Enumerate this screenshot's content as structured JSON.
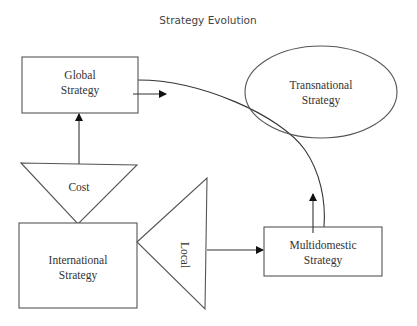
{
  "title": "Strategy Evolution",
  "colors": {
    "stroke": "#555555",
    "text": "#333333",
    "title": "#444444",
    "background": "#ffffff"
  },
  "nodes": {
    "global": {
      "shape": "rectangle",
      "line1": "Global",
      "line2": "Strategy"
    },
    "transnational": {
      "shape": "ellipse",
      "line1": "Transnational",
      "line2": "Strategy"
    },
    "international": {
      "shape": "rectangle",
      "line1": "International",
      "line2": "Strategy"
    },
    "multidomestic": {
      "shape": "rectangle",
      "line1": "Multidomestic",
      "line2": "Strategy"
    },
    "cost": {
      "shape": "triangle-down",
      "label": "Cost"
    },
    "local": {
      "shape": "triangle-left",
      "label": "Local"
    }
  },
  "edges": [
    {
      "from": "cost",
      "to": "global",
      "type": "arrow"
    },
    {
      "from": "local",
      "to": "multidomestic",
      "type": "arrow"
    },
    {
      "from": "global",
      "to": "transnational",
      "type": "arrow"
    },
    {
      "from": "multidomestic",
      "to": "transnational",
      "type": "arrow"
    },
    {
      "from": "global",
      "to": "multidomestic",
      "type": "curve"
    }
  ]
}
